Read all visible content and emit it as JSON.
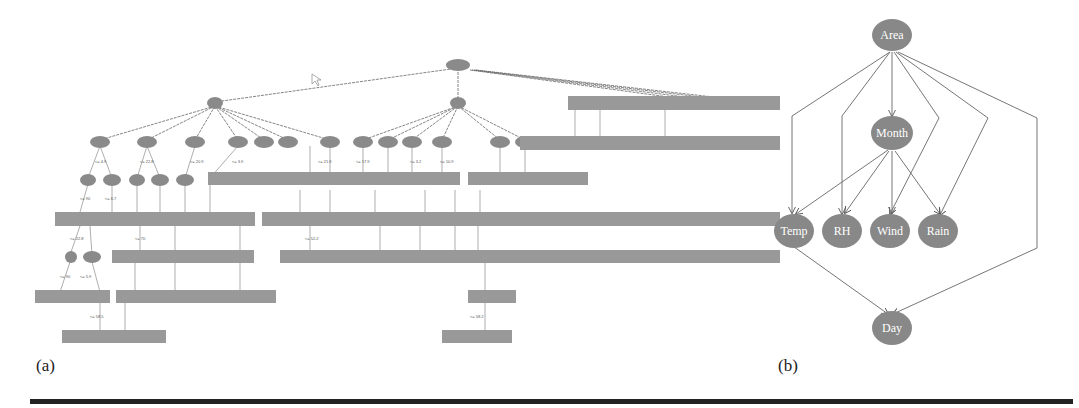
{
  "panel_a": {
    "caption": "(a)",
    "root_label": "Month",
    "description": "Decision tree (labels illegible at source resolution)"
  },
  "panel_b": {
    "caption": "(b)",
    "nodes": [
      {
        "id": "area",
        "label": "Area"
      },
      {
        "id": "month",
        "label": "Month"
      },
      {
        "id": "temp",
        "label": "Temp"
      },
      {
        "id": "rh",
        "label": "RH"
      },
      {
        "id": "wind",
        "label": "Wind"
      },
      {
        "id": "rain",
        "label": "Rain"
      },
      {
        "id": "day",
        "label": "Day"
      }
    ],
    "edges": [
      [
        "Area",
        "Month"
      ],
      [
        "Area",
        "Temp"
      ],
      [
        "Area",
        "RH"
      ],
      [
        "Area",
        "Wind"
      ],
      [
        "Area",
        "Rain"
      ],
      [
        "Area",
        "Day"
      ],
      [
        "Month",
        "Temp"
      ],
      [
        "Month",
        "RH"
      ],
      [
        "Month",
        "Wind"
      ],
      [
        "Month",
        "Rain"
      ],
      [
        "Temp",
        "Day"
      ]
    ]
  },
  "colors": {
    "node_fill": "#8a8a8a",
    "edge": "#555555",
    "rule": "#222222"
  }
}
